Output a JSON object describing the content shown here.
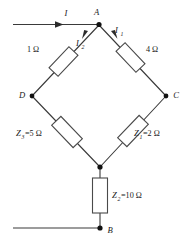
{
  "diagram": {
    "line_color": "#3a3a3a",
    "background_color": "#ffffff"
  },
  "nodes": {
    "a": {
      "label": "A"
    },
    "b": {
      "label": "B"
    },
    "c": {
      "label": "C"
    },
    "d": {
      "label": "D"
    }
  },
  "currents": {
    "total": {
      "symbol": "I",
      "subscript": ""
    },
    "branch1": {
      "symbol": "I",
      "subscript": "1"
    },
    "branch2": {
      "symbol": "I",
      "subscript": "2"
    }
  },
  "components": {
    "r_ad": {
      "value_label": "1 Ω"
    },
    "r_ac": {
      "value_label": "4 Ω"
    },
    "z3": {
      "symbol": "Z",
      "subscript": "3",
      "value_label": "=5 Ω"
    },
    "z1": {
      "symbol": "Z",
      "subscript": "1",
      "value_label": "=2 Ω"
    },
    "z2": {
      "symbol": "Z",
      "subscript": "2",
      "value_label": "=10 Ω"
    }
  }
}
